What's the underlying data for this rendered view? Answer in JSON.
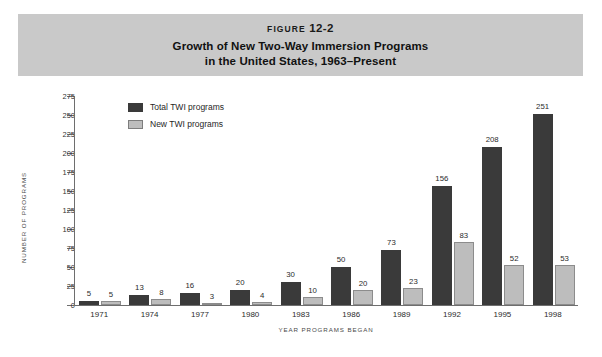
{
  "header": {
    "figure_prefix": "FIGURE",
    "figure_number": "12-2",
    "title_line1": "Growth of New Two-Way Immersion Programs",
    "title_line2": "in the United States, 1963–Present",
    "band_color": "#c9c9c9"
  },
  "chart_data": {
    "type": "bar",
    "title": "Growth of New Two-Way Immersion Programs in the United States, 1963–Present",
    "xlabel": "YEAR PROGRAMS BEGAN",
    "ylabel": "NUMBER OF PROGRAMS",
    "categories": [
      "1971",
      "1974",
      "1977",
      "1980",
      "1983",
      "1986",
      "1989",
      "1992",
      "1995",
      "1998"
    ],
    "series": [
      {
        "name": "Total TWI programs",
        "color": "#3a3a3a",
        "values": [
          5,
          13,
          16,
          20,
          30,
          50,
          73,
          156,
          208,
          251
        ]
      },
      {
        "name": "New TWI programs",
        "color": "#bdbdbd",
        "values": [
          5,
          8,
          3,
          4,
          10,
          20,
          23,
          83,
          52,
          53
        ]
      }
    ],
    "ylim": [
      0,
      275
    ],
    "ytick_step": 25,
    "yticks": [
      0,
      25,
      50,
      75,
      100,
      125,
      150,
      175,
      200,
      225,
      250,
      275
    ],
    "grid": false,
    "legend_position": "top-left-inside"
  }
}
